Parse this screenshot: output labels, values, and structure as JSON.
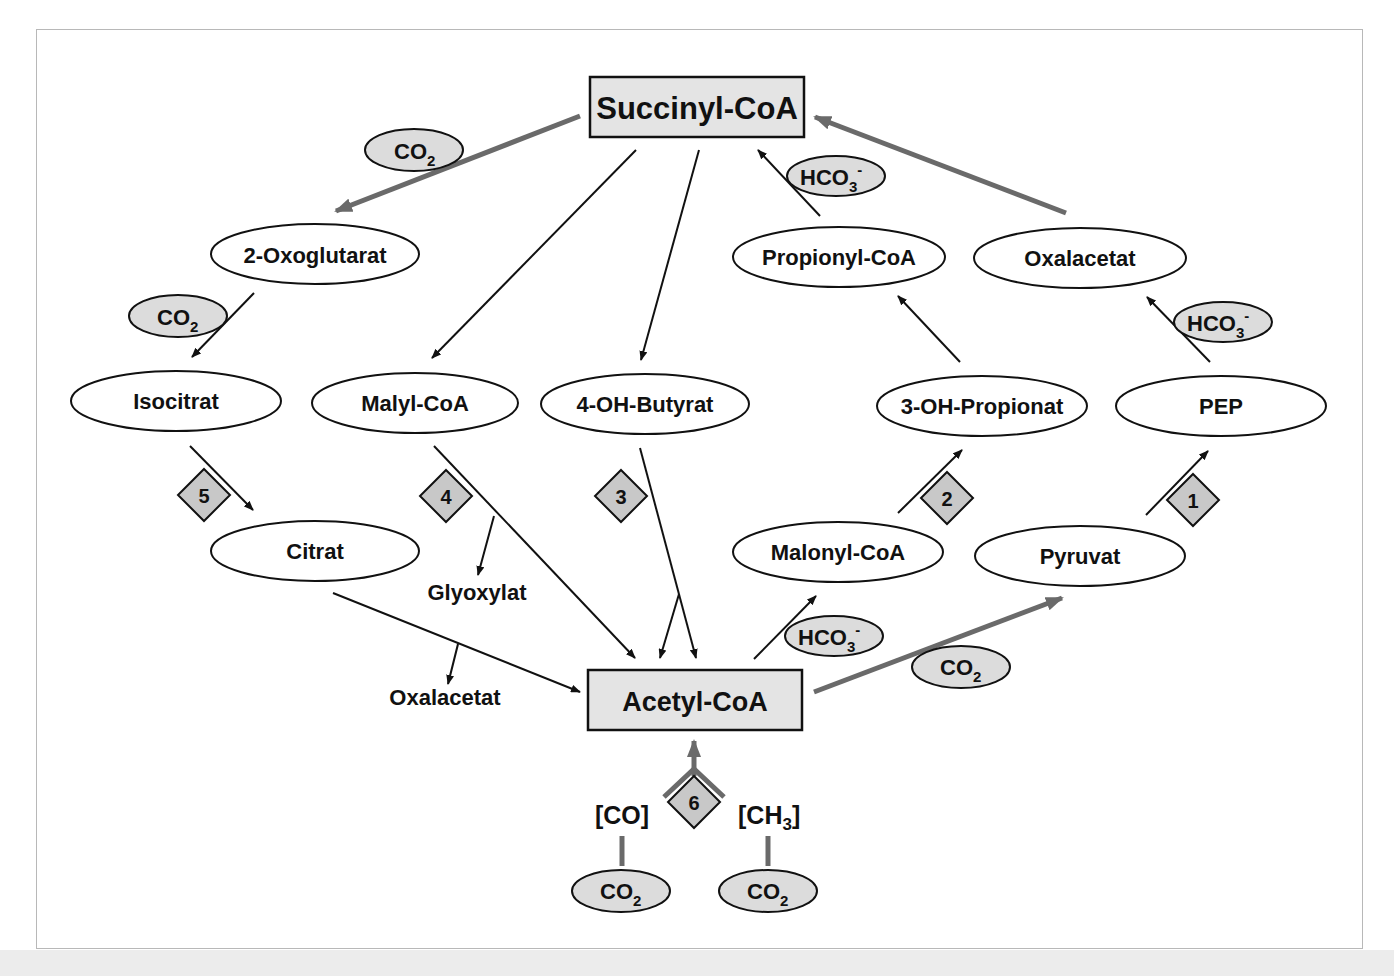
{
  "colors": {
    "box_fill": "#e4e4e4",
    "cofactor_fill": "#dcdcdc",
    "diamond_fill": "#c8c8c8",
    "thick_arrow": "#6a6a6a",
    "thin_arrow": "#111111",
    "frame_border": "#b8b8b8"
  },
  "nodes": {
    "succinyl_coa": "Succinyl-CoA",
    "acetyl_coa": "Acetyl-CoA",
    "oxoglutarat": "2-Oxoglutarat",
    "propionyl_coa": "Propionyl-CoA",
    "oxalacetat_top": "Oxalacetat",
    "isocitrat": "Isocitrat",
    "malyl_coa": "Malyl-CoA",
    "oh_butyrat": "4-OH-Butyrat",
    "oh_propionat": "3-OH-Propionat",
    "pep": "PEP",
    "citrat": "Citrat",
    "malonyl_coa": "Malonyl-CoA",
    "pyruvat": "Pyruvat"
  },
  "free_labels": {
    "glyoxylat": "Glyoxylat",
    "oxalacetat_bottom": "Oxalacetat",
    "co_bracket": "[CO]",
    "ch3_bracket_main": "[CH",
    "ch3_bracket_sub": "3",
    "ch3_bracket_close": "]"
  },
  "cofactors": {
    "co2_main": "CO",
    "co2_sub": "2",
    "hco3_main": "HCO",
    "hco3_sub": "3",
    "hco3_sup": "-"
  },
  "pathways": [
    {
      "number": "1"
    },
    {
      "number": "2"
    },
    {
      "number": "3"
    },
    {
      "number": "4"
    },
    {
      "number": "5"
    },
    {
      "number": "6"
    }
  ]
}
